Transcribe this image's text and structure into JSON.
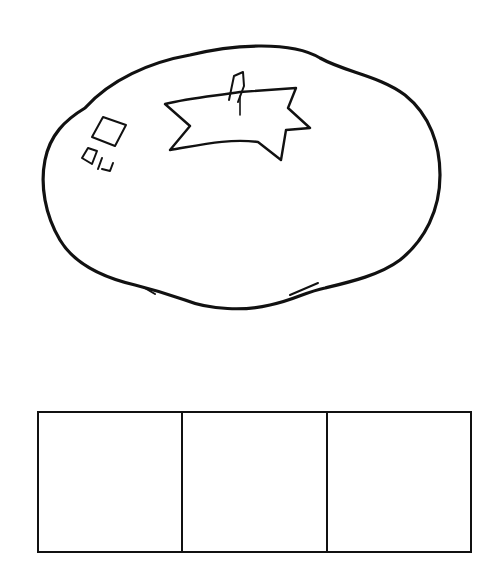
{
  "illustration": {
    "subject": "tomato",
    "style": "black-and-white line art",
    "stroke_color": "#111111",
    "background": "#ffffff"
  },
  "sound_boxes": {
    "count": 3,
    "items": [
      {
        "index": 1,
        "value": ""
      },
      {
        "index": 2,
        "value": ""
      },
      {
        "index": 3,
        "value": ""
      }
    ]
  }
}
